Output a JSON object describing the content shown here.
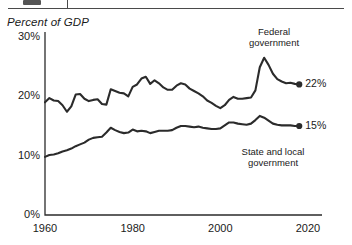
{
  "header": {
    "divider": "header-rule"
  },
  "chart_data": {
    "type": "line",
    "title": "",
    "axis_title": "Percent of GDP",
    "xlabel": "",
    "ylabel": "Percent of GDP",
    "xlim": [
      1960,
      2020
    ],
    "ylim": [
      0,
      30
    ],
    "xticks": [
      "1960",
      "1980",
      "2000",
      "2020"
    ],
    "yticks": [
      "0%",
      "10%",
      "20%",
      "30%"
    ],
    "grid": false,
    "legend": "annotations-inline",
    "annotations": [
      {
        "text_line1": "Federal",
        "text_line2": "government"
      },
      {
        "text_line1": "State and local",
        "text_line2": "government"
      }
    ],
    "end_labels": [
      {
        "series": "Federal government",
        "value": "22%"
      },
      {
        "series": "State and local government",
        "value": "15%"
      }
    ],
    "x": [
      1960,
      1961,
      1962,
      1963,
      1964,
      1965,
      1966,
      1967,
      1968,
      1969,
      1970,
      1971,
      1972,
      1973,
      1974,
      1975,
      1976,
      1977,
      1978,
      1979,
      1980,
      1981,
      1982,
      1983,
      1984,
      1985,
      1986,
      1987,
      1988,
      1989,
      1990,
      1991,
      1992,
      1993,
      1994,
      1995,
      1996,
      1997,
      1998,
      1999,
      2000,
      2001,
      2002,
      2003,
      2004,
      2005,
      2006,
      2007,
      2008,
      2009,
      2010,
      2011,
      2012,
      2013,
      2014,
      2015,
      2016,
      2017,
      2018
    ],
    "series": [
      {
        "name": "Federal government",
        "color": "#2b2b2b",
        "values": [
          19.0,
          19.7,
          19.3,
          19.2,
          18.5,
          17.4,
          18.3,
          20.3,
          20.4,
          19.6,
          19.2,
          19.4,
          19.5,
          18.7,
          18.6,
          21.2,
          20.9,
          20.6,
          20.5,
          20.0,
          21.6,
          22.0,
          23.0,
          23.3,
          22.1,
          22.7,
          22.2,
          21.5,
          21.1,
          21.1,
          21.8,
          22.2,
          22.0,
          21.3,
          20.9,
          20.5,
          20.0,
          19.3,
          18.9,
          18.4,
          18.0,
          18.5,
          19.4,
          19.9,
          19.6,
          19.6,
          19.7,
          19.8,
          21.0,
          24.9,
          26.5,
          25.3,
          23.8,
          22.9,
          22.5,
          22.2,
          22.3,
          22.1,
          22.0
        ]
      },
      {
        "name": "State and local government",
        "color": "#2b2b2b",
        "values": [
          9.8,
          10.1,
          10.2,
          10.4,
          10.7,
          10.9,
          11.2,
          11.6,
          11.9,
          12.2,
          12.7,
          13.0,
          13.1,
          13.2,
          13.9,
          14.7,
          14.3,
          14.0,
          13.8,
          13.9,
          14.4,
          14.1,
          14.2,
          14.1,
          13.8,
          14.0,
          14.2,
          14.2,
          14.2,
          14.3,
          14.7,
          15.0,
          15.0,
          14.9,
          14.8,
          14.9,
          14.7,
          14.6,
          14.5,
          14.5,
          14.6,
          15.1,
          15.6,
          15.6,
          15.4,
          15.3,
          15.2,
          15.4,
          16.0,
          16.7,
          16.4,
          15.9,
          15.4,
          15.2,
          15.1,
          15.1,
          15.1,
          15.0,
          15.0
        ]
      }
    ]
  }
}
